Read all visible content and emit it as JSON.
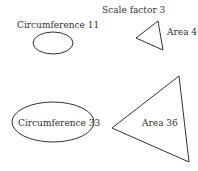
{
  "title": "Scale factor 3",
  "small": {
    "ellipse_label": "Circumference 11",
    "triangle_label": "Area 4"
  },
  "large": {
    "ellipse_label": "Circumference 33",
    "triangle_label": "Area 36"
  },
  "colors": {
    "stroke": "#333333",
    "background": "#ffffff"
  }
}
